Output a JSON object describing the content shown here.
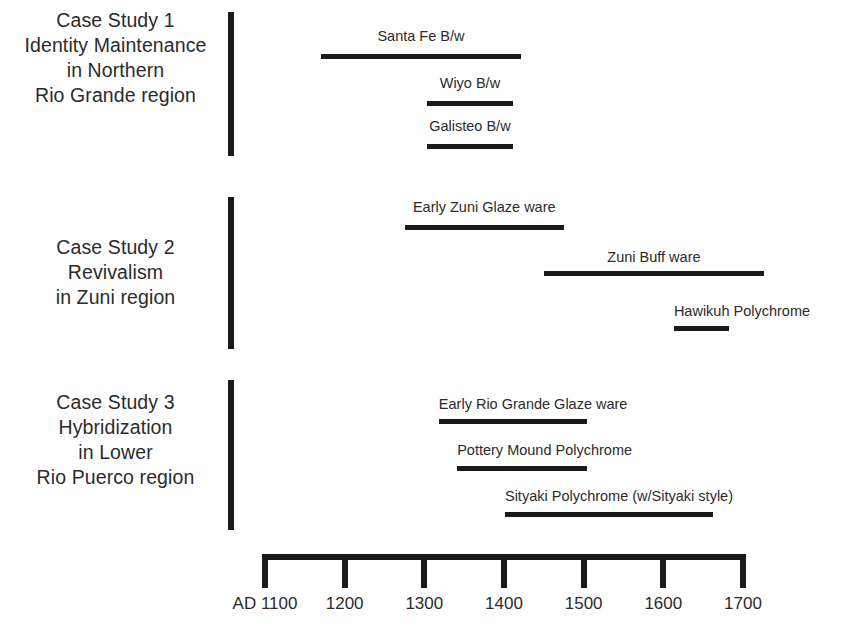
{
  "chart_data": {
    "type": "bar",
    "title": "",
    "xlabel": "",
    "ylabel": "",
    "orientation": "horizontal-timeline",
    "grid": false,
    "legend": "none",
    "axis": {
      "prefix": "AD",
      "ticks": [
        {
          "label": "AD 1100",
          "value": 1100
        },
        {
          "label": "1200",
          "value": 1200
        },
        {
          "label": "1300",
          "value": 1300
        },
        {
          "label": "1400",
          "value": 1400
        },
        {
          "label": "1500",
          "value": 1500
        },
        {
          "label": "1600",
          "value": 1600
        },
        {
          "label": "1700",
          "value": 1700
        }
      ],
      "xlim": [
        1100,
        1700
      ]
    },
    "groups": [
      {
        "id": "case-study-1",
        "label_lines": [
          "Case Study 1",
          "Identity Maintenance",
          "in Northern",
          "Rio Grande region"
        ],
        "bars": [
          {
            "name": "Santa Fe B/w",
            "start": 1174,
            "end": 1425
          },
          {
            "name": "Wiyo B/w",
            "start": 1307,
            "end": 1415
          },
          {
            "name": "Galisteo B/w",
            "start": 1307,
            "end": 1415
          }
        ]
      },
      {
        "id": "case-study-2",
        "label_lines": [
          "Case Study 2",
          "Revivalism",
          "in Zuni region"
        ],
        "bars": [
          {
            "name": "Early Zuni Glaze ware",
            "start": 1279,
            "end": 1479
          },
          {
            "name": "Zuni Buff ware",
            "start": 1454,
            "end": 1730
          },
          {
            "name": "Hawikuh Polychrome",
            "start": 1617,
            "end": 1686
          }
        ]
      },
      {
        "id": "case-study-3",
        "label_lines": [
          "Case Study 3",
          "Hybridization",
          "in Lower",
          "Rio Puerco region"
        ],
        "bars": [
          {
            "name": "Early Rio Grande Glaze ware",
            "start": 1322,
            "end": 1508
          },
          {
            "name": "Pottery Mound Polychrome",
            "start": 1345,
            "end": 1508
          },
          {
            "name": "Sityaki Polychrome (w/Sityaki style)",
            "start": 1405,
            "end": 1666
          }
        ]
      }
    ]
  }
}
